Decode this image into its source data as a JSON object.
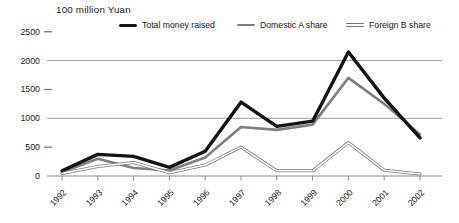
{
  "title": "100 million Yuan",
  "legend": {
    "items": [
      {
        "label": "Total money raised",
        "swatch": "thick-black-line"
      },
      {
        "label": "Domestic A share",
        "swatch": "gray-line"
      },
      {
        "label": "Foreign B share",
        "swatch": "white-double-line"
      }
    ]
  },
  "chart_data": {
    "type": "line",
    "title": "",
    "ylabel": "100 million Yuan",
    "xlabel": "",
    "categories": [
      "1992",
      "1993",
      "1994",
      "1995",
      "1996",
      "1997",
      "1998",
      "1999",
      "2000",
      "2001",
      "2002"
    ],
    "series": [
      {
        "name": "Total money raised",
        "color": "#141414",
        "style": "thick",
        "values": [
          90,
          375,
          340,
          150,
          430,
          1280,
          860,
          950,
          2150,
          1350,
          660
        ]
      },
      {
        "name": "Domestic A share",
        "color": "#7f7f7f",
        "style": "solid",
        "values": [
          65,
          300,
          140,
          95,
          320,
          850,
          800,
          890,
          1700,
          1250,
          720
        ]
      },
      {
        "name": "Foreign B share",
        "color": "#787878",
        "style": "double-white",
        "values": [
          45,
          165,
          235,
          55,
          190,
          500,
          90,
          90,
          580,
          100,
          35
        ]
      }
    ],
    "ylim": [
      0,
      2500
    ],
    "yticks": [
      0,
      500,
      1000,
      1500,
      2000,
      2500
    ],
    "major_gridlines": [
      1000,
      2000
    ],
    "minor_tick_values": [
      500,
      1500,
      2500
    ],
    "grid": "partial-horizontal",
    "legend_position": "top",
    "x_tick_label_rotation_deg": -45
  }
}
